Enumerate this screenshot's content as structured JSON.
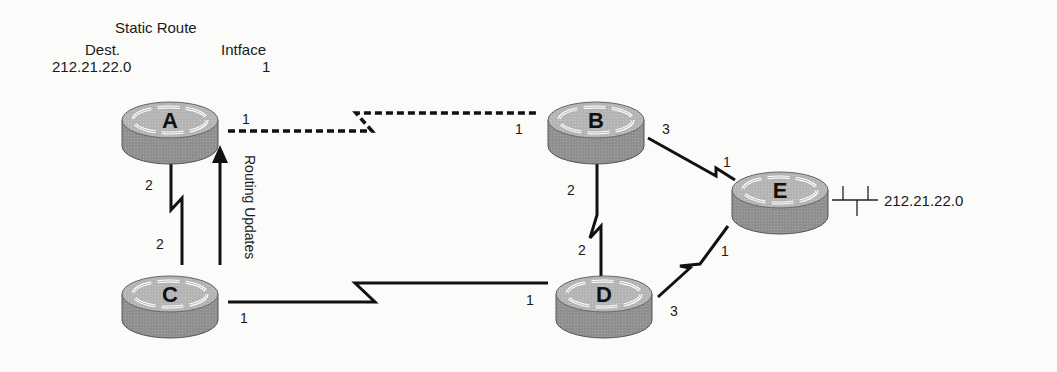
{
  "static_route": {
    "title": "Static Route",
    "dest_header": "Dest.",
    "intf_header": "Intface",
    "dest_value": "212.21.22.0",
    "intf_value": "1"
  },
  "routers": [
    {
      "id": "A",
      "label": "A"
    },
    {
      "id": "B",
      "label": "B"
    },
    {
      "id": "C",
      "label": "C"
    },
    {
      "id": "D",
      "label": "D"
    },
    {
      "id": "E",
      "label": "E"
    }
  ],
  "ports": {
    "A_1": "1",
    "A_2": "2",
    "B_1": "1",
    "B_2": "2",
    "B_3": "3",
    "C_1": "1",
    "C_2": "2",
    "D_1": "1",
    "D_2": "2",
    "D_3": "3",
    "E_1_top": "1",
    "E_1_bottom": "1"
  },
  "links": [
    {
      "from": "A",
      "to": "B",
      "style": "dashed-serial"
    },
    {
      "from": "A",
      "to": "C",
      "style": "serial"
    },
    {
      "from": "C",
      "to": "D",
      "style": "serial"
    },
    {
      "from": "B",
      "to": "D",
      "style": "serial"
    },
    {
      "from": "B",
      "to": "E",
      "style": "serial"
    },
    {
      "from": "D",
      "to": "E",
      "style": "serial"
    }
  ],
  "routing_updates_label": "Routing Updates",
  "network_label": "212.21.22.0"
}
